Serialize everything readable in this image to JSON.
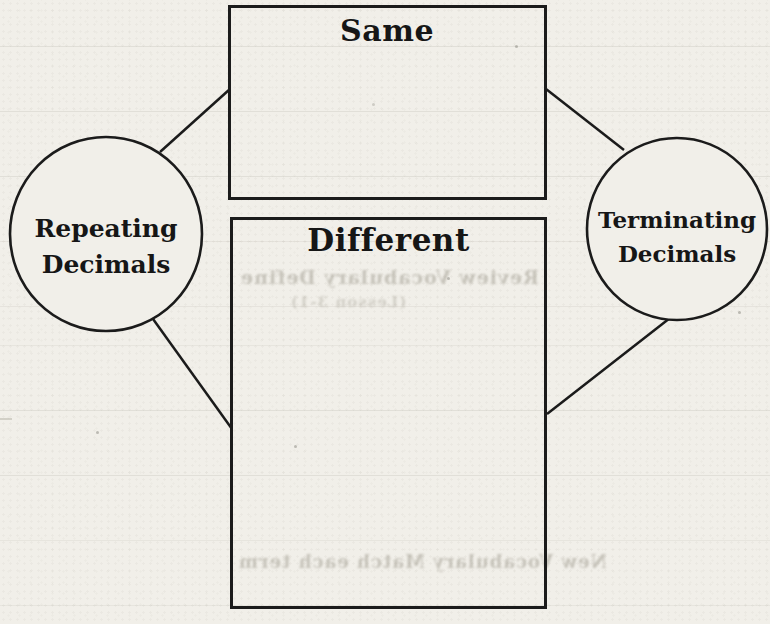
{
  "diagram": {
    "type": "compare-contrast",
    "top_box": {
      "label": "Same"
    },
    "bottom_box": {
      "label": "Different"
    },
    "left_circle": {
      "line1": "Repeating",
      "line2": "Decimals"
    },
    "right_circle": {
      "line1": "Terminating",
      "line2": "Decimals"
    }
  },
  "bleed_through_text": {
    "review_vocabulary": "Review Vocabulary Define",
    "lesson_ref": "(Lesson 3-1)",
    "new_vocabulary": "New Vocabulary Match each term"
  },
  "colors": {
    "paper": "#f1efe9",
    "ink": "#1b1b1b",
    "text": "#161616",
    "ghost": "#a39f93"
  }
}
